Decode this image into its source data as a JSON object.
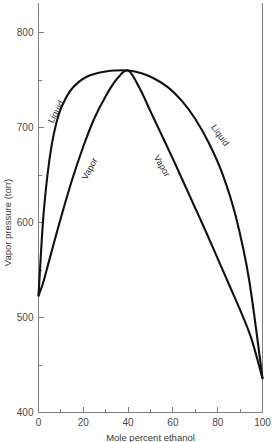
{
  "chart_data": {
    "type": "line",
    "title": "",
    "xlabel": "Mole percent ethanol",
    "ylabel": "Vapor pressure (torr)",
    "xlim": [
      0,
      100
    ],
    "ylim": [
      400,
      820
    ],
    "grid": false,
    "legend": "none",
    "x_major_ticks": [
      0,
      20,
      40,
      60,
      80,
      100
    ],
    "x_minor_ticks": [
      10,
      30,
      50,
      70,
      90
    ],
    "x_tick_labels": [
      "0",
      "20",
      "40",
      "60",
      "80",
      "100"
    ],
    "y_major_ticks": [
      400,
      500,
      600,
      700,
      800
    ],
    "y_minor_ticks": [
      450,
      550,
      650,
      750
    ],
    "y_tick_labels": [
      "400",
      "500",
      "600",
      "700",
      "800"
    ],
    "azeotrope": {
      "x": 40,
      "y": 760
    },
    "series": [
      {
        "name": "Liquid",
        "label": "Liquid",
        "x": [
          0,
          2,
          4,
          6,
          8,
          10,
          14,
          18,
          22,
          26,
          30,
          34,
          40,
          46,
          52,
          58,
          64,
          70,
          76,
          82,
          88,
          94,
          100
        ],
        "y": [
          523,
          601,
          650,
          683,
          705,
          720,
          738,
          748,
          754,
          757,
          759,
          760,
          760,
          757,
          751,
          742,
          728,
          709,
          684,
          652,
          607,
          540,
          436
        ]
      },
      {
        "name": "Vapor",
        "label": "Vapor",
        "x": [
          0,
          2,
          5,
          10,
          15,
          20,
          25,
          30,
          35,
          40,
          45,
          50,
          55,
          60,
          65,
          70,
          75,
          80,
          85,
          90,
          95,
          100
        ],
        "y": [
          523,
          536,
          562,
          605,
          645,
          680,
          710,
          733,
          751,
          760,
          742,
          717,
          692,
          667,
          641,
          615,
          589,
          562,
          535,
          508,
          478,
          436
        ]
      }
    ],
    "annotations": [
      {
        "text": "Liquid",
        "x": 9,
        "y": 715,
        "rotation": -62,
        "name": "liquid-label-left"
      },
      {
        "text": "Vapor",
        "x": 24,
        "y": 655,
        "rotation": -62,
        "name": "vapor-label-left"
      },
      {
        "text": "Vapor",
        "x": 54,
        "y": 658,
        "rotation": 60,
        "name": "vapor-label-right"
      },
      {
        "text": "Liquid",
        "x": 80,
        "y": 690,
        "rotation": 54,
        "name": "liquid-label-right"
      }
    ],
    "colors": {
      "curve": "#111111",
      "axis": "#808080",
      "text": "#3a3a3a",
      "background": "#ffffff"
    }
  }
}
